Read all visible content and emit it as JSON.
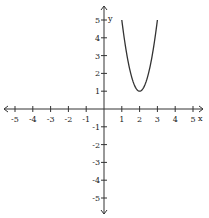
{
  "chart_data": {
    "type": "line",
    "title": "",
    "xlabel": "x",
    "ylabel": "y",
    "xlim": [
      -5,
      5
    ],
    "ylim": [
      -5,
      5
    ],
    "grid": false,
    "x_ticks": [
      -5,
      -4,
      -3,
      -2,
      -1,
      1,
      2,
      3,
      4,
      5
    ],
    "y_ticks": [
      -5,
      -4,
      -3,
      -2,
      -1,
      1,
      2,
      3,
      4,
      5
    ],
    "series": [
      {
        "name": "parabola",
        "equation": "y = 4(x - 2)^2 + 1",
        "x": [
          1,
          1.25,
          1.5,
          1.75,
          2,
          2.25,
          2.5,
          2.75,
          3
        ],
        "values": [
          5,
          3.25,
          2,
          1.25,
          1,
          1.25,
          2,
          3.25,
          5
        ],
        "vertex": [
          2,
          1
        ],
        "color": "#333333"
      }
    ]
  },
  "axes": {
    "x_label": "x",
    "y_label": "y",
    "color": "#333333"
  }
}
